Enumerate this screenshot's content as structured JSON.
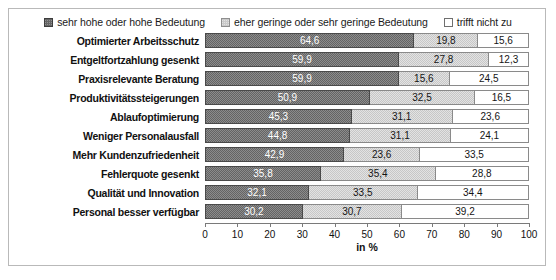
{
  "chart_data": {
    "type": "bar",
    "subtype": "stacked-horizontal-100",
    "title": "",
    "xlabel": "in %",
    "ylabel": "",
    "xlim": [
      0,
      100
    ],
    "xticks": [
      "0",
      "10",
      "20",
      "30",
      "40",
      "50",
      "60",
      "70",
      "80",
      "90",
      "100"
    ],
    "grid": false,
    "legend_position": "top-center",
    "categories": [
      "Optimierter Arbeitsschutz",
      "Entgeltfortzahlung gesenkt",
      "Praxisrelevante Beratung",
      "Produktivitätssteigerungen",
      "Ablaufoptimierung",
      "Weniger Personalausfall",
      "Mehr Kundenzufriedenheit",
      "Fehlerquote gesenkt",
      "Qualität und Innovation",
      "Personal besser verfügbar"
    ],
    "series": [
      {
        "name": "sehr hohe oder hohe Bedeutung",
        "color": "#646464",
        "values": [
          64.6,
          59.9,
          59.9,
          50.9,
          45.3,
          44.8,
          42.9,
          35.8,
          32.1,
          30.2
        ],
        "labels": [
          "64,6",
          "59,9",
          "59,9",
          "50,9",
          "45,3",
          "44,8",
          "42,9",
          "35,8",
          "32,1",
          "30,2"
        ]
      },
      {
        "name": "eher geringe oder sehr geringe Bedeutung",
        "color": "#c7c7c7",
        "values": [
          19.8,
          27.8,
          15.6,
          32.5,
          31.1,
          31.1,
          23.6,
          35.4,
          33.5,
          30.7
        ],
        "labels": [
          "19,8",
          "27,8",
          "15,6",
          "32,5",
          "31,1",
          "31,1",
          "23,6",
          "35,4",
          "33,5",
          "30,7"
        ]
      },
      {
        "name": "trifft nicht zu",
        "color": "#ffffff",
        "values": [
          15.6,
          12.3,
          24.5,
          16.5,
          23.6,
          24.1,
          33.5,
          28.8,
          34.4,
          39.2
        ],
        "labels": [
          "15,6",
          "12,3",
          "24,5",
          "16,5",
          "23,6",
          "24,1",
          "33,5",
          "28,8",
          "34,4",
          "39,2"
        ]
      }
    ]
  }
}
